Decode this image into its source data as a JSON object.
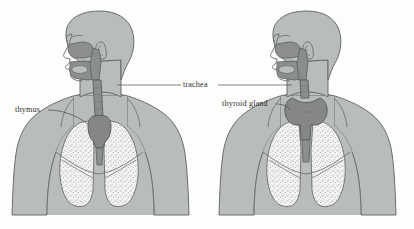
{
  "diagram": {
    "background_color": "#fdfdfc",
    "type": "anatomical-illustration",
    "figure_count": 2
  },
  "labels": {
    "trachea": "trachea",
    "thymus": "thymus",
    "thyroid": "thyroid gland"
  },
  "figures": [
    {
      "id": "left-figure",
      "name": "human-upper-body-thymus",
      "highlighted_organ": "thymus",
      "parts": [
        "head",
        "neck",
        "shoulders",
        "arms",
        "chest",
        "lungs",
        "trachea",
        "nasal-cavity",
        "oral-cavity",
        "thymus"
      ]
    },
    {
      "id": "right-figure",
      "name": "human-upper-body-thyroid",
      "highlighted_organ": "thyroid gland",
      "parts": [
        "head",
        "neck",
        "shoulders",
        "arms",
        "chest",
        "lungs",
        "trachea",
        "nasal-cavity",
        "oral-cavity",
        "thyroid-gland"
      ]
    }
  ],
  "colors": {
    "body_fill": "#b8bcba",
    "body_stroke": "#6a6d6c",
    "airway_fill": "#8b8e8d",
    "airway_stroke": "#5c5f5e",
    "organ_fill": "#848786",
    "organ_stroke": "#555857",
    "lung_fill": "#f4f4f2",
    "lung_stroke": "#6a6d6c",
    "leader_line": "#4a4a4a",
    "text": "#2e2e2e"
  }
}
